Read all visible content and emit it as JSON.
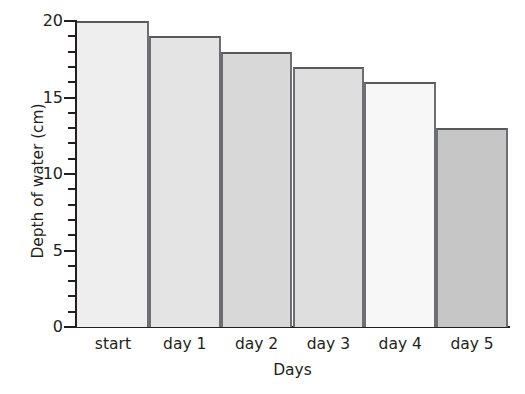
{
  "chart_data": {
    "type": "bar",
    "title": "",
    "xlabel": "Days",
    "ylabel": "Depth of water (cm)",
    "categories": [
      "start",
      "day 1",
      "day 2",
      "day 3",
      "day 4",
      "day 5"
    ],
    "values": [
      20,
      19,
      18,
      17,
      16,
      13
    ],
    "ylim": [
      0,
      20
    ],
    "y_major_ticks": [
      0,
      5,
      10,
      15,
      20
    ],
    "y_major_tick_labels": [
      "0",
      "5",
      "10",
      "15",
      "20"
    ],
    "y_minor_tick_step": 1,
    "grid": false,
    "legend": null,
    "bar_colors": [
      "#eeeeee",
      "#e4e4e4",
      "#d8d8d8",
      "#dedede",
      "#f7f7f7",
      "#c6c6c6"
    ],
    "bar_edge_color": "#58595b",
    "axis_color": "#231f20"
  }
}
